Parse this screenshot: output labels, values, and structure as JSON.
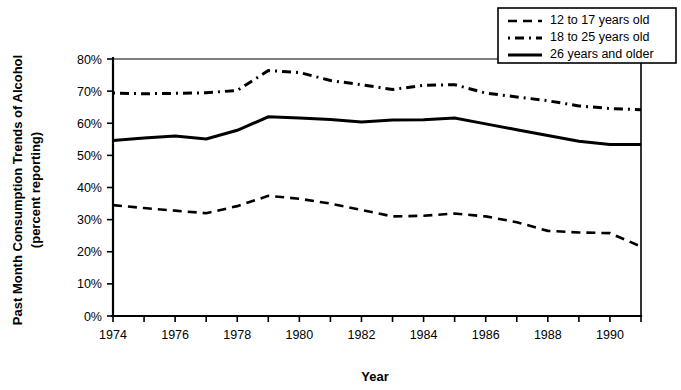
{
  "chart_data": {
    "type": "line",
    "title": "",
    "xlabel": "Year",
    "ylabel": "Past Month Consumption Trends of Alcohol (percent reporting)",
    "ylabel_line1": "Past Month Consumption Trends of Alcohol",
    "ylabel_line2": "(percent reporting)",
    "x": [
      1974,
      1975,
      1976,
      1977,
      1978,
      1979,
      1980,
      1981,
      1982,
      1983,
      1984,
      1985,
      1986,
      1987,
      1988,
      1989,
      1990,
      1991
    ],
    "xlim": [
      1974,
      1991
    ],
    "ylim": [
      0,
      80
    ],
    "ytick_values": [
      0,
      10,
      20,
      30,
      40,
      50,
      60,
      70,
      80
    ],
    "ytick_labels": [
      "0%",
      "10%",
      "20%",
      "30%",
      "40%",
      "50%",
      "60%",
      "70%",
      "80%"
    ],
    "xtick_values": [
      1974,
      1975,
      1976,
      1977,
      1978,
      1979,
      1980,
      1981,
      1982,
      1983,
      1984,
      1985,
      1986,
      1987,
      1988,
      1989,
      1990,
      1991
    ],
    "xtick_labels": [
      "1974",
      "",
      "1976",
      "",
      "1978",
      "",
      "1980",
      "",
      "1982",
      "",
      "1984",
      "",
      "1986",
      "",
      "1988",
      "",
      "1990",
      ""
    ],
    "grid": false,
    "legend_position": "top-right",
    "series": [
      {
        "name": "12 to 17 years old",
        "style": "dashed",
        "dasharray": "9,6",
        "width": 2.6,
        "values": [
          34.5,
          33.6,
          32.8,
          32.0,
          34.2,
          37.4,
          36.5,
          35.0,
          33.0,
          31.0,
          31.2,
          31.9,
          31.0,
          29.2,
          26.5,
          26.0,
          25.8,
          21.6
        ]
      },
      {
        "name": "18 to 25 years old",
        "style": "dash-dot",
        "dasharray": "2,5,9,5",
        "width": 3.0,
        "values": [
          69.4,
          69.2,
          69.3,
          69.5,
          70.2,
          76.4,
          75.8,
          73.3,
          72.0,
          70.5,
          71.8,
          72.0,
          69.4,
          68.2,
          67.0,
          65.4,
          64.6,
          64.2
        ]
      },
      {
        "name": "26 years and older",
        "style": "solid",
        "dasharray": "none",
        "width": 3.0,
        "values": [
          54.6,
          55.4,
          56.0,
          55.1,
          57.8,
          62.0,
          61.6,
          61.2,
          60.4,
          61.0,
          61.1,
          61.6,
          59.8,
          58.0,
          56.2,
          54.4,
          53.4,
          53.4
        ]
      }
    ]
  },
  "legend": {
    "entries": [
      {
        "label": "12 to 17 years old"
      },
      {
        "label": "18 to 25 years old"
      },
      {
        "label": "26 years and older"
      }
    ]
  }
}
